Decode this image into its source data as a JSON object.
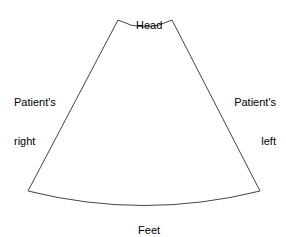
{
  "diagram": {
    "name": "ultrasound-sector-orientation",
    "background_color": "#ffffff",
    "stroke_color": "#444444",
    "stroke_width": 1,
    "text_color": "#000000"
  },
  "labels": {
    "head": "Head",
    "feet": "Feet",
    "patient_right_line1": "Patient's",
    "patient_right_line2": "right",
    "patient_left_line1": "Patient's",
    "patient_left_line2": "left"
  },
  "geometry": {
    "top_left": {
      "x": 118,
      "y": 20
    },
    "top_right": {
      "x": 172,
      "y": 20
    },
    "bottom_right": {
      "x": 260,
      "y": 191
    },
    "bottom_left": {
      "x": 28,
      "y": 191
    },
    "top_arc_center_y": 28,
    "bottom_arc_center_y": 207,
    "top_arc_curve": "concave-down",
    "bottom_arc_curve": "convex-down",
    "path": "M 118 20 Q 145 34 172 20 L 260 191 Q 144 220 28 191 Z"
  }
}
